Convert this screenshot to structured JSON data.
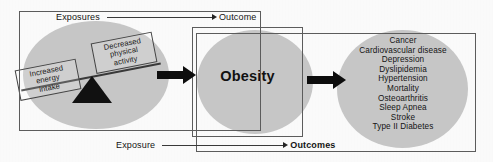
{
  "figure": {
    "colors": {
      "ellipse_fill": "#c9c9c9",
      "frame_stroke": "#5d5d5d",
      "arrow_fill": "#0d0d0d",
      "text": "#141414",
      "background": "#fdfdfd"
    }
  },
  "panels": {
    "left": {
      "name": "exposures-panel",
      "connector": {
        "from_label": "Exposures",
        "to_label": "Outcome",
        "arrow": "right-arrow-icon"
      },
      "seesaw": {
        "left_weight": "Increased energy intake",
        "left_weight_lines": [
          "Increased",
          "energy",
          "intake"
        ],
        "right_weight": "Decreased physical activity",
        "right_weight_lines": [
          "Decreased",
          "physical",
          "activity"
        ],
        "fulcrum": "triangle-fulcrum-icon"
      }
    },
    "middle": {
      "name": "obesity-panel",
      "label": "Obesity"
    },
    "right": {
      "name": "outcomes-panel",
      "connector": {
        "from_label": "Exposure",
        "to_label": "Outcomes",
        "arrow": "right-arrow-icon"
      },
      "outcomes": [
        "Cancer",
        "Cardiovascular disease",
        "Depression",
        "Dyslipidemia",
        "Hypertension",
        "Mortality",
        "Osteoarthritis",
        "Sleep Apnea",
        "Stroke",
        "Type II Diabetes"
      ]
    }
  },
  "arrows": {
    "exposures_to_obesity": "thick-right-arrow-icon",
    "obesity_to_outcomes": "thick-right-arrow-icon"
  }
}
